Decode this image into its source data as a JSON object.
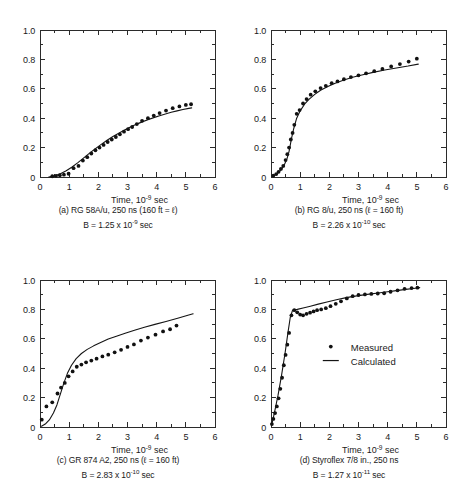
{
  "figure": {
    "background": "#ffffff",
    "ink_color": "#141414"
  },
  "axes_common": {
    "xlabel_prefix": "Time, 10",
    "xlabel_exponent": "-9",
    "xlabel_suffix": " sec",
    "x_ticklabels": [
      "0",
      "1",
      "2",
      "3",
      "4",
      "5",
      "6"
    ],
    "y_ticklabels": [
      "0",
      "0.2",
      "0.4",
      "0.6",
      "0.8",
      "1.0"
    ],
    "xlim": [
      0,
      6
    ],
    "ylim": [
      0,
      1.0
    ]
  },
  "legend": {
    "position": "inside-panel-d",
    "entries": [
      {
        "marker": "dot",
        "label": "Measured"
      },
      {
        "marker": "line",
        "label": "Calculated"
      }
    ]
  },
  "panels": [
    {
      "id": "a",
      "caption_line1": "(a) RG 58A/u, 250 ns (160 ft = ℓ)",
      "caption_line2_prefix": "B = 1.25 x 10",
      "caption_line2_exponent": "-9",
      "caption_line2_suffix": " sec"
    },
    {
      "id": "b",
      "caption_line1": "(b) RG 8/u, 250 ns (ℓ = 160 ft)",
      "caption_line2_prefix": "B = 2.26 x 10",
      "caption_line2_exponent": "-10",
      "caption_line2_suffix": " sec"
    },
    {
      "id": "c",
      "caption_line1": "(c) GR 874 A2, 250 ns (ℓ = 160 ft)",
      "caption_line2_prefix": "B = 2.83 x 10",
      "caption_line2_exponent": "-10",
      "caption_line2_suffix": " sec"
    },
    {
      "id": "d",
      "caption_line1": "(d) Styroflex 7/8 in., 250 ns",
      "caption_line2_prefix": "B = 1.27 x 10",
      "caption_line2_exponent": "-11",
      "caption_line2_suffix": " sec"
    }
  ],
  "chart_data": [
    {
      "type": "scatter",
      "panel": "a",
      "title": "(a) RG 58A/u, 250 ns (160 ft = l)",
      "xlabel": "Time, 10^-9 sec",
      "ylabel": "",
      "xlim": [
        0,
        6
      ],
      "ylim": [
        0,
        1.0
      ],
      "grid": false,
      "series": [
        {
          "name": "Measured",
          "style": "points",
          "x": [
            0.42,
            0.55,
            0.68,
            0.82,
            0.98,
            1.15,
            1.32,
            1.47,
            1.62,
            1.76,
            1.9,
            2.04,
            2.18,
            2.32,
            2.46,
            2.6,
            2.74,
            2.88,
            3.02,
            3.16,
            3.32,
            3.5,
            3.7,
            3.9,
            4.1,
            4.32,
            4.55,
            4.78,
            5.0,
            5.18
          ],
          "y": [
            0.005,
            0.008,
            0.012,
            0.016,
            0.022,
            0.06,
            0.075,
            0.112,
            0.135,
            0.16,
            0.182,
            0.2,
            0.218,
            0.238,
            0.255,
            0.272,
            0.29,
            0.308,
            0.325,
            0.34,
            0.36,
            0.382,
            0.4,
            0.418,
            0.435,
            0.452,
            0.468,
            0.48,
            0.49,
            0.495
          ]
        },
        {
          "name": "Calculated",
          "style": "line",
          "x": [
            0.3,
            0.5,
            0.7,
            0.9,
            1.1,
            1.3,
            1.5,
            1.7,
            1.9,
            2.1,
            2.3,
            2.5,
            2.7,
            2.9,
            3.1,
            3.3,
            3.5,
            3.7,
            3.9,
            4.1,
            4.3,
            4.5,
            4.7,
            4.9,
            5.1,
            5.2
          ],
          "y": [
            0.0,
            0.008,
            0.022,
            0.042,
            0.068,
            0.098,
            0.13,
            0.162,
            0.193,
            0.222,
            0.25,
            0.275,
            0.298,
            0.32,
            0.34,
            0.358,
            0.375,
            0.39,
            0.404,
            0.417,
            0.429,
            0.44,
            0.45,
            0.459,
            0.467,
            0.47
          ]
        }
      ]
    },
    {
      "type": "scatter",
      "panel": "b",
      "title": "(b) RG 8/u, 250 ns (l = 160 ft)",
      "xlabel": "Time, 10^-9 sec",
      "ylabel": "",
      "xlim": [
        0,
        6
      ],
      "ylim": [
        0,
        1.0
      ],
      "grid": false,
      "series": [
        {
          "name": "Measured",
          "style": "points",
          "x": [
            0.08,
            0.18,
            0.26,
            0.34,
            0.42,
            0.5,
            0.56,
            0.62,
            0.68,
            0.74,
            0.8,
            0.88,
            0.98,
            1.1,
            1.22,
            1.36,
            1.52,
            1.7,
            1.88,
            2.08,
            2.28,
            2.5,
            2.74,
            3.0,
            3.26,
            3.54,
            3.82,
            4.12,
            4.42,
            4.72,
            5.0
          ],
          "y": [
            0.01,
            0.02,
            0.035,
            0.055,
            0.075,
            0.115,
            0.155,
            0.2,
            0.255,
            0.3,
            0.355,
            0.43,
            0.455,
            0.5,
            0.53,
            0.56,
            0.583,
            0.605,
            0.62,
            0.638,
            0.65,
            0.665,
            0.68,
            0.692,
            0.705,
            0.72,
            0.735,
            0.752,
            0.768,
            0.785,
            0.805
          ]
        },
        {
          "name": "Calculated",
          "style": "line",
          "x": [
            0.05,
            0.15,
            0.25,
            0.35,
            0.45,
            0.55,
            0.62,
            0.7,
            0.78,
            0.88,
            1.0,
            1.15,
            1.3,
            1.5,
            1.7,
            1.95,
            2.2,
            2.5,
            2.8,
            3.15,
            3.5,
            3.9,
            4.3,
            4.7,
            5.05
          ],
          "y": [
            0.005,
            0.015,
            0.03,
            0.05,
            0.08,
            0.125,
            0.175,
            0.26,
            0.33,
            0.4,
            0.45,
            0.495,
            0.528,
            0.562,
            0.59,
            0.616,
            0.638,
            0.66,
            0.678,
            0.696,
            0.712,
            0.728,
            0.742,
            0.755,
            0.768
          ]
        }
      ]
    },
    {
      "type": "scatter",
      "panel": "c",
      "title": "(c) GR 874 A2, 250 ns (l = 160 ft)",
      "xlabel": "Time, 10^-9 sec",
      "ylabel": "",
      "xlim": [
        0,
        6
      ],
      "ylim": [
        0,
        1.0
      ],
      "grid": false,
      "series": [
        {
          "name": "Measured",
          "style": "points",
          "x": [
            0.06,
            0.22,
            0.42,
            0.6,
            0.72,
            0.85,
            0.98,
            1.12,
            1.26,
            1.42,
            1.58,
            1.76,
            1.94,
            2.14,
            2.34,
            2.56,
            2.78,
            3.0,
            3.22,
            3.46,
            3.7,
            3.96,
            4.22,
            4.46,
            4.68
          ],
          "y": [
            0.05,
            0.14,
            0.168,
            0.228,
            0.268,
            0.3,
            0.345,
            0.378,
            0.41,
            0.425,
            0.44,
            0.452,
            0.465,
            0.48,
            0.492,
            0.508,
            0.525,
            0.545,
            0.562,
            0.588,
            0.608,
            0.628,
            0.65,
            0.665,
            0.69
          ]
        },
        {
          "name": "Calculated",
          "style": "line",
          "x": [
            0.05,
            0.18,
            0.32,
            0.46,
            0.58,
            0.7,
            0.82,
            0.94,
            1.08,
            1.24,
            1.42,
            1.62,
            1.84,
            2.08,
            2.34,
            2.62,
            2.92,
            3.24,
            3.58,
            3.94,
            4.32,
            4.72,
            5.1,
            5.25
          ],
          "y": [
            0.005,
            0.02,
            0.048,
            0.095,
            0.15,
            0.225,
            0.3,
            0.365,
            0.42,
            0.465,
            0.5,
            0.528,
            0.552,
            0.575,
            0.598,
            0.618,
            0.638,
            0.658,
            0.678,
            0.698,
            0.718,
            0.74,
            0.762,
            0.77
          ]
        }
      ]
    },
    {
      "type": "scatter",
      "panel": "d",
      "title": "(d) Styroflex 7/8 in., 250 ns",
      "xlabel": "Time, 10^-9 sec",
      "ylabel": "",
      "xlim": [
        0,
        6
      ],
      "ylim": [
        0,
        1.0
      ],
      "grid": false,
      "series": [
        {
          "name": "Measured",
          "style": "points",
          "x": [
            0.03,
            0.08,
            0.14,
            0.2,
            0.26,
            0.32,
            0.38,
            0.44,
            0.5,
            0.56,
            0.62,
            0.7,
            0.8,
            0.9,
            1.0,
            1.1,
            1.22,
            1.34,
            1.46,
            1.58,
            1.72,
            1.88,
            2.04,
            2.22,
            2.4,
            2.6,
            2.8,
            3.0,
            3.22,
            3.44,
            3.66,
            3.88,
            4.1,
            4.34,
            4.58,
            4.82,
            5.02
          ],
          "y": [
            0.02,
            0.055,
            0.095,
            0.14,
            0.195,
            0.26,
            0.335,
            0.42,
            0.49,
            0.56,
            0.64,
            0.76,
            0.795,
            0.78,
            0.765,
            0.76,
            0.77,
            0.778,
            0.786,
            0.795,
            0.8,
            0.808,
            0.822,
            0.838,
            0.855,
            0.875,
            0.89,
            0.898,
            0.902,
            0.905,
            0.908,
            0.91,
            0.92,
            0.93,
            0.94,
            0.945,
            0.948
          ]
        },
        {
          "name": "Calculated",
          "style": "line",
          "x": [
            0.02,
            0.12,
            0.24,
            0.36,
            0.48,
            0.58,
            0.66,
            0.74,
            0.9,
            1.1,
            1.35,
            1.62,
            1.92,
            2.24,
            2.58,
            2.94,
            3.3,
            3.68,
            4.0,
            4.3,
            4.62,
            4.95,
            5.1
          ],
          "y": [
            0.01,
            0.1,
            0.215,
            0.35,
            0.5,
            0.64,
            0.745,
            0.795,
            0.8,
            0.81,
            0.822,
            0.836,
            0.85,
            0.866,
            0.88,
            0.892,
            0.902,
            0.912,
            0.92,
            0.928,
            0.936,
            0.944,
            0.948
          ]
        }
      ]
    }
  ]
}
